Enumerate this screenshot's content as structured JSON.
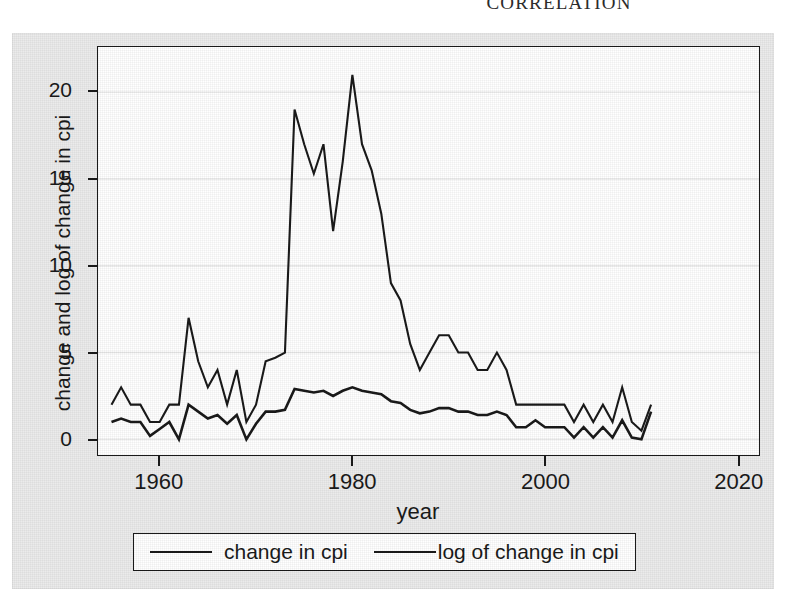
{
  "page": {
    "running_head": "CORRELATION"
  },
  "figure": {
    "background_color": "#ebebeb",
    "plot_background_color": "#ffffff",
    "line_color": "#1a1a1a",
    "grid_color": "#e8e8e8"
  },
  "axes": {
    "y_title": "change and log of change in cpi",
    "x_title": "year",
    "y_ticks": [
      "0",
      "5",
      "10",
      "15",
      "20"
    ],
    "x_ticks": [
      "1960",
      "1980",
      "2000",
      "2020"
    ]
  },
  "legend": {
    "entries": [
      {
        "label": "change in cpi"
      },
      {
        "label": "log of change in cpi"
      }
    ]
  },
  "chart_data": {
    "type": "line",
    "title": "",
    "xlabel": "year",
    "ylabel": "change and log of change in cpi",
    "xlim": [
      1953.6,
      2022.2
    ],
    "ylim": [
      -0.9,
      22.6
    ],
    "xticks": [
      1960,
      1980,
      2000,
      2020
    ],
    "yticks": [
      0,
      5,
      10,
      15,
      20
    ],
    "grid": "horizontal",
    "legend_position": "below-axes",
    "x": [
      1955,
      1956,
      1957,
      1958,
      1959,
      1960,
      1961,
      1962,
      1963,
      1964,
      1965,
      1966,
      1967,
      1968,
      1969,
      1970,
      1971,
      1972,
      1973,
      1974,
      1975,
      1976,
      1977,
      1978,
      1979,
      1980,
      1981,
      1982,
      1983,
      1984,
      1985,
      1986,
      1987,
      1988,
      1989,
      1990,
      1991,
      1992,
      1993,
      1994,
      1995,
      1996,
      1997,
      1998,
      1999,
      2000,
      2001,
      2002,
      2003,
      2004,
      2005,
      2006,
      2007,
      2008,
      2009,
      2010,
      2011
    ],
    "series": [
      {
        "name": "change in cpi",
        "values": [
          2.0,
          3.0,
          2.0,
          2.0,
          1.0,
          1.0,
          2.0,
          2.0,
          7.0,
          4.5,
          3.0,
          4.0,
          2.0,
          4.0,
          1.0,
          2.0,
          4.5,
          4.7,
          5.0,
          19.0,
          17.0,
          15.3,
          17.0,
          12.0,
          16.0,
          21.0,
          17.0,
          15.5,
          13.0,
          9.0,
          8.0,
          5.5,
          4.0,
          5.0,
          6.0,
          6.0,
          5.0,
          5.0,
          4.0,
          4.0,
          5.0,
          4.0,
          2.0,
          2.0,
          2.0,
          2.0,
          2.0,
          2.0,
          1.0,
          2.0,
          1.0,
          2.0,
          1.0,
          3.0,
          1.0,
          0.5,
          2.0
        ]
      },
      {
        "name": "log of change in cpi",
        "values": [
          1.0,
          1.2,
          1.0,
          1.0,
          0.2,
          0.6,
          1.0,
          0.0,
          2.0,
          1.6,
          1.2,
          1.4,
          0.9,
          1.4,
          0.0,
          0.9,
          1.6,
          1.6,
          1.7,
          2.9,
          2.8,
          2.7,
          2.8,
          2.5,
          2.8,
          3.0,
          2.8,
          2.7,
          2.6,
          2.2,
          2.1,
          1.7,
          1.5,
          1.6,
          1.8,
          1.8,
          1.6,
          1.6,
          1.4,
          1.4,
          1.6,
          1.4,
          0.7,
          0.7,
          1.1,
          0.7,
          0.7,
          0.7,
          0.1,
          0.7,
          0.1,
          0.7,
          0.1,
          1.1,
          0.1,
          0.0,
          1.6
        ]
      }
    ]
  }
}
